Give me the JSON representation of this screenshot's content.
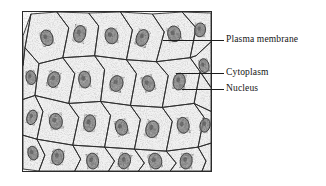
{
  "figure": {
    "kind": "labeled-micrograph",
    "background_color": "#ffffff",
    "frame": {
      "border_color": "#2b2b2b",
      "fill_color": "#fdfdfd",
      "x": 22,
      "y": 11,
      "width": 190,
      "height": 161
    }
  },
  "labels": [
    {
      "id": "plasma-membrane",
      "text": "Plasma membrane",
      "text_x": 226,
      "text_y": 34,
      "leader": {
        "x": 163,
        "y": 40,
        "length": 61,
        "color": "#1c1c1c"
      }
    },
    {
      "id": "cytoplasm",
      "text": "Cytoplasm",
      "text_x": 226,
      "text_y": 67,
      "leader": {
        "x": 176,
        "y": 73,
        "length": 48,
        "color": "#1c1c1c"
      }
    },
    {
      "id": "nucleus",
      "text": "Nucleus",
      "text_x": 226,
      "text_y": 83,
      "leader": {
        "x": 182,
        "y": 89,
        "length": 42,
        "color": "#1c1c1c"
      }
    }
  ],
  "micrograph": {
    "cell_outline_color": "#2a2a2a",
    "nucleus_fill_color": "#8e8e8e",
    "nucleus_outline_color": "#2a2a2a",
    "cytoplasm_tint": "#f2f2f2",
    "cell_count_visible": 34,
    "nucleus_count_visible": 26,
    "cells": [
      {
        "points": "8,2 34,0 46,16 40,46 16,52 2,36",
        "nucleus": {
          "cx": 24,
          "cy": 26,
          "rx": 6,
          "ry": 8,
          "rot": -18
        }
      },
      {
        "points": "34,0 66,1 76,14 72,44 40,46 46,16",
        "nucleus": {
          "cx": 57,
          "cy": 22,
          "rx": 6,
          "ry": 8.5,
          "rot": 12
        }
      },
      {
        "points": "66,1 98,0 110,18 104,48 72,44 76,14",
        "nucleus": {
          "cx": 89,
          "cy": 24,
          "rx": 6.5,
          "ry": 8,
          "rot": -8
        }
      },
      {
        "points": "98,0 130,2 142,20 134,50 104,48 110,18",
        "nucleus": {
          "cx": 120,
          "cy": 26,
          "rx": 6,
          "ry": 8.5,
          "rot": 20
        }
      },
      {
        "points": "130,2 160,0 174,16 168,46 134,50 142,20",
        "nucleus": {
          "cx": 152,
          "cy": 22,
          "rx": 6.5,
          "ry": 8,
          "rot": -14
        }
      },
      {
        "points": "160,0 189,1 189,30 174,44 168,46 174,16",
        "nucleus": {
          "cx": 178,
          "cy": 18,
          "rx": 5.5,
          "ry": 7,
          "rot": 8
        }
      },
      {
        "points": "0,24 8,2 2,36 0,54",
        "nucleus": null
      },
      {
        "points": "2,36 16,52 12,84 0,88 0,54",
        "nucleus": {
          "cx": 8,
          "cy": 66,
          "rx": 5,
          "ry": 7,
          "rot": -10
        }
      },
      {
        "points": "16,52 40,46 52,62 46,92 12,84",
        "nucleus": {
          "cx": 31,
          "cy": 68,
          "rx": 6,
          "ry": 8,
          "rot": 16
        }
      },
      {
        "points": "40,46 72,44 82,58 78,90 46,92 52,62",
        "nucleus": {
          "cx": 62,
          "cy": 68,
          "rx": 6,
          "ry": 8.5,
          "rot": -6
        }
      },
      {
        "points": "72,44 104,48 114,62 108,94 78,90 82,58",
        "nucleus": {
          "cx": 94,
          "cy": 72,
          "rx": 6.5,
          "ry": 8,
          "rot": 14
        }
      },
      {
        "points": "104,48 134,50 146,64 140,96 108,94 114,62",
        "nucleus": {
          "cx": 126,
          "cy": 72,
          "rx": 6,
          "ry": 8,
          "rot": -20
        }
      },
      {
        "points": "134,50 168,46 178,60 172,92 140,96 146,64",
        "nucleus": {
          "cx": 157,
          "cy": 70,
          "rx": 6,
          "ry": 8.5,
          "rot": 10
        }
      },
      {
        "points": "168,46 174,44 189,30 189,76 178,60",
        "nucleus": {
          "cx": 182,
          "cy": 54,
          "rx": 5,
          "ry": 7,
          "rot": -12
        }
      },
      {
        "points": "178,60 189,76 189,100 172,92",
        "nucleus": null
      },
      {
        "points": "0,88 12,84 20,100 14,128 0,124",
        "nucleus": {
          "cx": 9,
          "cy": 106,
          "rx": 5,
          "ry": 7.5,
          "rot": 18
        }
      },
      {
        "points": "12,84 46,92 56,106 50,134 14,128 20,100",
        "nucleus": {
          "cx": 33,
          "cy": 110,
          "rx": 6.5,
          "ry": 8,
          "rot": -10
        }
      },
      {
        "points": "46,92 78,90 88,104 82,136 50,134 56,106",
        "nucleus": {
          "cx": 67,
          "cy": 112,
          "rx": 6,
          "ry": 8.5,
          "rot": 6
        }
      },
      {
        "points": "78,90 108,94 118,108 112,138 82,136 88,104",
        "nucleus": {
          "cx": 99,
          "cy": 116,
          "rx": 6,
          "ry": 8,
          "rot": -16
        }
      },
      {
        "points": "108,94 140,96 150,110 144,140 112,138 118,108",
        "nucleus": {
          "cx": 130,
          "cy": 118,
          "rx": 6.5,
          "ry": 8.5,
          "rot": 12
        }
      },
      {
        "points": "140,96 172,92 182,106 176,136 144,140 150,110",
        "nucleus": {
          "cx": 161,
          "cy": 114,
          "rx": 6,
          "ry": 8,
          "rot": -8
        }
      },
      {
        "points": "172,92 189,100 189,132 176,136 182,106",
        "nucleus": {
          "cx": 183,
          "cy": 114,
          "rx": 5,
          "ry": 7,
          "rot": 14
        }
      },
      {
        "points": "0,124 14,128 22,144 16,160 0,158",
        "nucleus": {
          "cx": 10,
          "cy": 142,
          "rx": 5,
          "ry": 7,
          "rot": -14
        }
      },
      {
        "points": "14,128 50,134 58,148 52,160 16,160 22,144",
        "nucleus": {
          "cx": 35,
          "cy": 146,
          "rx": 6,
          "ry": 8,
          "rot": 10
        }
      },
      {
        "points": "50,134 82,136 92,150 86,160 52,160 58,148",
        "nucleus": {
          "cx": 70,
          "cy": 150,
          "rx": 6,
          "ry": 8,
          "rot": -6
        }
      },
      {
        "points": "82,136 112,138 122,152 116,160 86,160 92,150",
        "nucleus": {
          "cx": 102,
          "cy": 150,
          "rx": 6,
          "ry": 8,
          "rot": 16
        }
      },
      {
        "points": "112,138 144,140 154,152 148,160 116,160 122,152",
        "nucleus": {
          "cx": 133,
          "cy": 150,
          "rx": 6.5,
          "ry": 8,
          "rot": -12
        }
      },
      {
        "points": "144,140 176,136 184,150 180,160 148,160 154,152",
        "nucleus": {
          "cx": 164,
          "cy": 150,
          "rx": 6,
          "ry": 8,
          "rot": 8
        }
      },
      {
        "points": "176,136 189,132 189,160 180,160 184,150",
        "nucleus": null
      }
    ]
  }
}
